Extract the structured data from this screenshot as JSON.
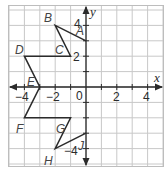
{
  "diagram": {
    "type": "coordinate-plane",
    "axes": {
      "x_label": "x",
      "y_label": "y",
      "origin_label": "0",
      "x_range": [
        -5,
        5
      ],
      "y_range": [
        -5,
        5
      ],
      "x_tick_labels": [
        {
          "value": -4,
          "text": "−4"
        },
        {
          "value": -2,
          "text": "−2"
        },
        {
          "value": 2,
          "text": "2"
        },
        {
          "value": 4,
          "text": "4"
        }
      ],
      "y_tick_labels": [
        {
          "value": 4,
          "text": "4"
        },
        {
          "value": 2,
          "text": "2"
        },
        {
          "value": -4,
          "text": "−4"
        }
      ]
    },
    "polyline": {
      "name": "ABCDEFGHJ",
      "color": "#2b2b2b",
      "points": [
        {
          "label": "A",
          "x": 0,
          "y": 3
        },
        {
          "label": "B",
          "x": -2,
          "y": 4
        },
        {
          "label": "C",
          "x": -1,
          "y": 2
        },
        {
          "label": "D",
          "x": -4,
          "y": 2
        },
        {
          "label": "E",
          "x": -3,
          "y": 0
        },
        {
          "label": "F",
          "x": -4,
          "y": -2
        },
        {
          "label": "G",
          "x": -1,
          "y": -2
        },
        {
          "label": "H",
          "x": -2,
          "y": -4
        },
        {
          "label": "J",
          "x": 0,
          "y": -3
        }
      ]
    }
  }
}
